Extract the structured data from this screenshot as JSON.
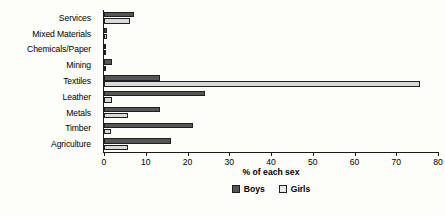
{
  "chart_data": {
    "type": "bar",
    "orientation": "horizontal",
    "title": "",
    "xlabel": "% of each sex",
    "ylabel": "",
    "xlim": [
      0,
      80
    ],
    "xticks": [
      0,
      10,
      20,
      30,
      40,
      50,
      60,
      70,
      80
    ],
    "xtick_labels": [
      "0",
      "10",
      "20",
      "30",
      "40",
      "50",
      "60",
      "70",
      "80"
    ],
    "grid": false,
    "legend_position": "bottom-center",
    "categories": [
      "Services",
      "Mixed Materials",
      "Chemicals/Paper",
      "Mining",
      "Textiles",
      "Leather",
      "Metals",
      "Timber",
      "Agriculture"
    ],
    "series": [
      {
        "name": "Boys",
        "color": "#555555",
        "values": [
          7.2,
          0.6,
          0.5,
          1.8,
          13.5,
          24.2,
          13.5,
          21.3,
          16.0
        ]
      },
      {
        "name": "Girls",
        "color": "#d9d9d9",
        "values": [
          6.2,
          0.8,
          0.4,
          0.2,
          75.8,
          2.0,
          5.8,
          1.7,
          5.8
        ]
      }
    ]
  },
  "legend": {
    "items": [
      {
        "label": "Boys"
      },
      {
        "label": "Girls"
      }
    ]
  },
  "colors": {
    "background": "#fdfdfa",
    "axis": "#1a1a1a",
    "boys": "#555555",
    "girls": "#d9d9d9",
    "text": "#000000"
  }
}
